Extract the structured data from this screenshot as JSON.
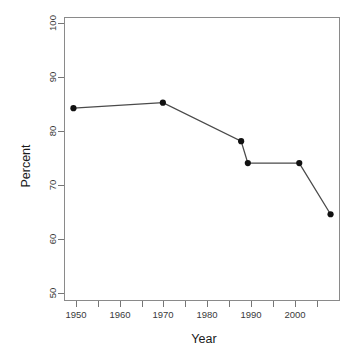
{
  "chart_data": {
    "type": "line",
    "title": "",
    "subtitle": "",
    "xlabel": "Year",
    "ylabel": "Percent",
    "x": [
      1950,
      1970,
      1987.5,
      1989,
      2000.5,
      2007.5
    ],
    "values": [
      85,
      86,
      79,
      75,
      75,
      65.7
    ],
    "series": [
      {
        "name": "Percent",
        "x": [
          1950,
          1970,
          1987.5,
          1989,
          2000.5,
          2007.5
        ],
        "values": [
          85,
          86,
          79,
          75,
          75,
          65.7
        ]
      }
    ],
    "points": [
      {
        "x": 1950,
        "y": 85
      },
      {
        "x": 1970,
        "y": 86
      },
      {
        "x": 1987.5,
        "y": 79
      },
      {
        "x": 1989,
        "y": 75
      },
      {
        "x": 2000.5,
        "y": 75
      },
      {
        "x": 2007.5,
        "y": 65.7
      }
    ],
    "xlim": [
      1948,
      2009.5
    ],
    "ylim": [
      50,
      101.5
    ],
    "x_major_ticks": [
      1950,
      1960,
      1970,
      1980,
      1990,
      2000
    ],
    "x_minor_ticks": [
      1955,
      1965,
      1975,
      1985,
      1995,
      2005
    ],
    "x_tick_labels": [
      "1950",
      "1960",
      "1970",
      "1980",
      "1990",
      "2000"
    ],
    "y_ticks": [
      50,
      60,
      70,
      80,
      90,
      100
    ],
    "y_tick_labels": [
      "50",
      "60",
      "70",
      "80",
      "90",
      "100"
    ],
    "grid": false,
    "legend": false,
    "legend_position": "none",
    "marker": "filled-circle",
    "line_color": "#4a4a4a",
    "point_color": "#111111",
    "frame_color": "#8a8a8a",
    "background": "#ffffff",
    "y_label_rotation": "vertical",
    "y_tick_label_rotation": "vertical"
  },
  "axes": {
    "x_title": "Year",
    "y_title": "Percent"
  },
  "ticks": {
    "x": [
      "1950",
      "1960",
      "1970",
      "1980",
      "1990",
      "2000"
    ],
    "y": [
      "50",
      "60",
      "70",
      "80",
      "90",
      "100"
    ]
  }
}
